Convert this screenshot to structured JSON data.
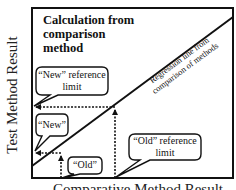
{
  "diagram": {
    "title_lines": [
      "Calculation from",
      "comparison",
      "method"
    ],
    "y_axis_label": "Test Method Result",
    "x_axis_label": "Comparative Method Result",
    "regression_label_lines": [
      "Regression line from",
      "comparison of methods"
    ],
    "callouts": {
      "new_reference_limit": [
        "“New” reference",
        "limit"
      ],
      "new": "“New”",
      "old": "“Old”",
      "old_reference_limit": [
        "“Old” reference",
        "limit"
      ]
    },
    "colors": {
      "line": "#111111",
      "background": "#ffffff"
    }
  }
}
